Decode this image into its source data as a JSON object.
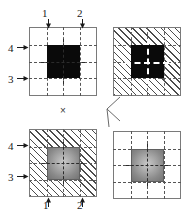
{
  "figure": {
    "title": "",
    "background": "#ffffff",
    "panel_border_color": "#7a7a7a",
    "grid_line_color": "#606060",
    "hatch_color": "#4c4c4c",
    "solid_block_color": "#0a0a0a",
    "gradient_block_colors": [
      "#c9c9c9",
      "#a6a6a6",
      "#8a8a8a",
      "#737373"
    ],
    "grid_divisions": 4,
    "panels": [
      {
        "id": "top-left",
        "fill": "plain",
        "block": "solid-black",
        "crosshair": "dark",
        "position": "top-left"
      },
      {
        "id": "top-right",
        "fill": "hatched",
        "block": "solid-black",
        "crosshair": "light",
        "position": "top-right"
      },
      {
        "id": "bottom-left",
        "fill": "hatched",
        "block": "gradient-gray",
        "crosshair": "dark",
        "position": "bottom-left"
      },
      {
        "id": "bottom-right",
        "fill": "plain",
        "block": "gradient-gray",
        "crosshair": "dark",
        "position": "bottom-right"
      }
    ],
    "callouts": {
      "top_arrows": [
        {
          "label": "1",
          "direction": "down"
        },
        {
          "label": "2",
          "direction": "down"
        }
      ],
      "top_left_side_arrows": [
        {
          "label": "4",
          "direction": "right"
        },
        {
          "label": "3",
          "direction": "right"
        }
      ],
      "bottom_left_side_arrows": [
        {
          "label": "4",
          "direction": "right"
        },
        {
          "label": "3",
          "direction": "right"
        }
      ],
      "bottom_arrows": [
        {
          "label": "1",
          "direction": "up"
        },
        {
          "label": "2",
          "direction": "up"
        }
      ]
    },
    "marks": {
      "center_x": "×",
      "right_connector": "<"
    }
  }
}
